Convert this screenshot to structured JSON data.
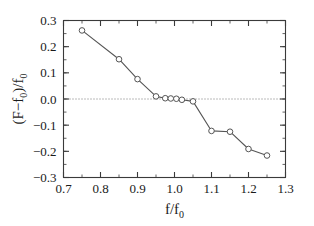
{
  "chart_data": {
    "type": "line",
    "title": "",
    "subtitle": "",
    "xlabel": "f/f_0",
    "ylabel": "(F−f_0)/f_0",
    "xlabel_parts": {
      "main": "f/f",
      "sub": "0"
    },
    "ylabel_parts": {
      "pre": "(F−f",
      "sub1": "0",
      "mid": ")/f",
      "sub2": "0"
    },
    "xlim": [
      0.7,
      1.3
    ],
    "ylim": [
      -0.3,
      0.3
    ],
    "xticks": [
      0.7,
      0.8,
      0.9,
      1.0,
      1.1,
      1.2,
      1.3
    ],
    "xtick_labels": [
      "0.7",
      "0.8",
      "0.9",
      "1.0",
      "1.1",
      "1.2",
      "1.3"
    ],
    "yticks": [
      -0.3,
      -0.2,
      -0.1,
      0.0,
      0.1,
      0.2,
      0.3
    ],
    "ytick_labels": [
      "−0.3",
      "−0.2",
      "−0.1",
      "0.0",
      "0.1",
      "0.2",
      "0.3"
    ],
    "xminor_step": 0.05,
    "yminor_step": 0.05,
    "grid": false,
    "zero_line": true,
    "zero_line_style": "dotted",
    "legend": null,
    "marker": "circle-open",
    "marker_size": 4,
    "line_color": "#555555",
    "marker_edge_color": "#555555",
    "marker_face_color": "#ffffff",
    "axis_color": "#3a3a3a",
    "series": [
      {
        "name": "measured",
        "x": [
          0.75,
          0.85,
          0.9,
          0.95,
          0.975,
          0.99,
          1.005,
          1.02,
          1.05,
          1.1,
          1.15,
          1.2,
          1.25
        ],
        "y": [
          0.262,
          0.152,
          0.076,
          0.01,
          0.003,
          0.002,
          0.001,
          -0.003,
          -0.009,
          -0.122,
          -0.125,
          -0.191,
          -0.216
        ]
      }
    ]
  },
  "figure": {
    "background": "#ffffff",
    "frame_color": "#3a3a3a"
  }
}
